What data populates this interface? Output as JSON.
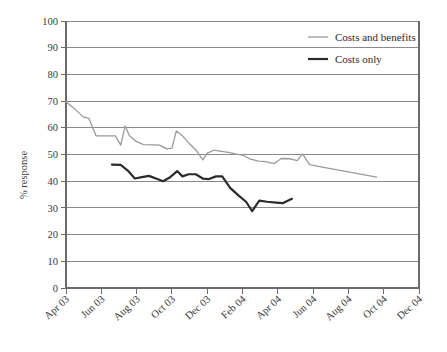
{
  "chart_data": {
    "type": "line",
    "title": "",
    "xlabel": "",
    "ylabel": "% response",
    "ylim": [
      0,
      100
    ],
    "ytick_values": [
      0,
      10,
      20,
      30,
      40,
      50,
      60,
      70,
      80,
      90,
      100
    ],
    "ytick_labels": [
      "0",
      "10",
      "20",
      "30",
      "40",
      "50",
      "60",
      "70",
      "80",
      "90",
      "100"
    ],
    "xtick_labels": [
      "Apr 03",
      "Jun 03",
      "Aug 03",
      "Oct 03",
      "Dec 03",
      "Feb 04",
      "Apr 04",
      "Jun 04",
      "Aug 04",
      "Oct 04",
      "Dec 04"
    ],
    "grid": "horizontal",
    "legend_position": "top-right",
    "x_months": [
      "Apr 03",
      "May 03",
      "Jun 03",
      "Jul 03",
      "Aug 03",
      "Sep 03",
      "Oct 03",
      "Nov 03",
      "Dec 03",
      "Jan 04",
      "Feb 04",
      "Mar 04",
      "Apr 04",
      "May 04",
      "Jun 04",
      "Jul 04",
      "Aug 04",
      "Sep 04",
      "Oct 04",
      "Nov 04",
      "Dec 04"
    ],
    "series": [
      {
        "name": "Costs and benefits",
        "color": "#9a9a9a",
        "width": 1.3,
        "x_start_index": 0,
        "points": [
          {
            "x": 0.0,
            "y": 69.8
          },
          {
            "x": 0.5,
            "y": 67.0
          },
          {
            "x": 1.0,
            "y": 64.0
          },
          {
            "x": 1.3,
            "y": 63.5
          },
          {
            "x": 1.7,
            "y": 57.0
          },
          {
            "x": 2.1,
            "y": 57.0
          },
          {
            "x": 2.5,
            "y": 57.0
          },
          {
            "x": 2.8,
            "y": 57.0
          },
          {
            "x": 3.1,
            "y": 53.5
          },
          {
            "x": 3.35,
            "y": 60.7
          },
          {
            "x": 3.6,
            "y": 57.0
          },
          {
            "x": 4.0,
            "y": 54.8
          },
          {
            "x": 4.4,
            "y": 53.7
          },
          {
            "x": 4.9,
            "y": 53.6
          },
          {
            "x": 5.3,
            "y": 53.5
          },
          {
            "x": 5.7,
            "y": 52.1
          },
          {
            "x": 6.0,
            "y": 52.4
          },
          {
            "x": 6.25,
            "y": 58.8
          },
          {
            "x": 6.6,
            "y": 57.0
          },
          {
            "x": 7.0,
            "y": 54.0
          },
          {
            "x": 7.4,
            "y": 51.4
          },
          {
            "x": 7.75,
            "y": 48.0
          },
          {
            "x": 8.0,
            "y": 50.5
          },
          {
            "x": 8.4,
            "y": 51.6
          },
          {
            "x": 8.8,
            "y": 51.2
          },
          {
            "x": 9.2,
            "y": 50.8
          },
          {
            "x": 9.6,
            "y": 50.2
          },
          {
            "x": 10.0,
            "y": 49.8
          },
          {
            "x": 10.4,
            "y": 48.4
          },
          {
            "x": 10.9,
            "y": 47.5
          },
          {
            "x": 11.3,
            "y": 47.3
          },
          {
            "x": 11.8,
            "y": 46.6
          },
          {
            "x": 12.2,
            "y": 48.5
          },
          {
            "x": 12.7,
            "y": 48.4
          },
          {
            "x": 13.1,
            "y": 47.7
          },
          {
            "x": 13.4,
            "y": 50.2
          },
          {
            "x": 13.8,
            "y": 46.2
          },
          {
            "x": 14.6,
            "y": 45.2
          },
          {
            "x": 16.0,
            "y": 43.5
          },
          {
            "x": 17.6,
            "y": 41.5
          }
        ]
      },
      {
        "name": "Costs only",
        "color": "#2b2b2b",
        "width": 2.2,
        "x_start_index": 2.6,
        "points": [
          {
            "x": 2.6,
            "y": 46.2
          },
          {
            "x": 3.1,
            "y": 46.1
          },
          {
            "x": 3.5,
            "y": 44.0
          },
          {
            "x": 3.9,
            "y": 41.0
          },
          {
            "x": 4.3,
            "y": 41.5
          },
          {
            "x": 4.7,
            "y": 42.0
          },
          {
            "x": 5.1,
            "y": 41.0
          },
          {
            "x": 5.5,
            "y": 40.0
          },
          {
            "x": 5.9,
            "y": 41.5
          },
          {
            "x": 6.3,
            "y": 43.8
          },
          {
            "x": 6.6,
            "y": 41.8
          },
          {
            "x": 6.95,
            "y": 42.6
          },
          {
            "x": 7.35,
            "y": 42.6
          },
          {
            "x": 7.75,
            "y": 41.0
          },
          {
            "x": 8.1,
            "y": 40.8
          },
          {
            "x": 8.5,
            "y": 41.8
          },
          {
            "x": 8.85,
            "y": 41.8
          },
          {
            "x": 9.3,
            "y": 37.5
          },
          {
            "x": 9.8,
            "y": 34.5
          },
          {
            "x": 10.2,
            "y": 32.3
          },
          {
            "x": 10.55,
            "y": 28.8
          },
          {
            "x": 10.95,
            "y": 32.7
          },
          {
            "x": 11.4,
            "y": 32.3
          },
          {
            "x": 11.9,
            "y": 32.0
          },
          {
            "x": 12.3,
            "y": 31.8
          },
          {
            "x": 12.8,
            "y": 33.4
          }
        ]
      }
    ],
    "legend": [
      {
        "label": "Costs and benefits",
        "color": "#9a9a9a",
        "width": 1.3
      },
      {
        "label": "Costs only",
        "color": "#2b2b2b",
        "width": 2.2
      }
    ]
  }
}
